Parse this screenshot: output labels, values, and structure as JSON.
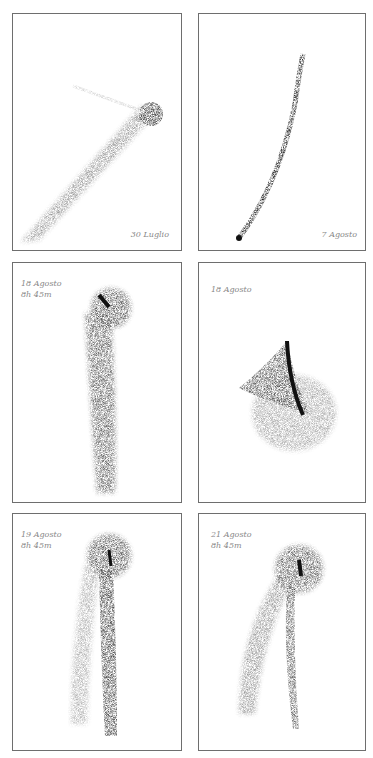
{
  "panels": [
    {
      "id": "p1",
      "label": "30 Luglio",
      "time": ""
    },
    {
      "id": "p2",
      "label": "7 Agosto",
      "time": ""
    },
    {
      "id": "p3",
      "label": "18 Agosto",
      "time": "8h 45m"
    },
    {
      "id": "p4",
      "label": "18 Agosto",
      "time": ""
    },
    {
      "id": "p5",
      "label": "19 Agosto",
      "time": "8h 45m"
    },
    {
      "id": "p6",
      "label": "21 Agosto",
      "time": "8h 45m"
    }
  ],
  "colors": {
    "border": "#6e6e6e",
    "ink": "#222222",
    "label": "#888888"
  }
}
